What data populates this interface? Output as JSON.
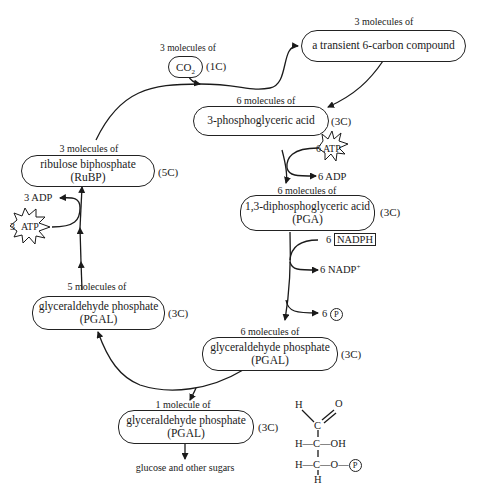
{
  "nodes": {
    "co2": {
      "count": "3 molecules of",
      "name": "CO",
      "sub": "2",
      "carbons": "(1C)"
    },
    "transient": {
      "count": "3 molecules of",
      "name": "a transient 6-carbon compound"
    },
    "pga3": {
      "count": "6 molecules of",
      "name": "3-phosphoglyceric acid",
      "carbons": "(3C)"
    },
    "dpga": {
      "count": "6 molecules of",
      "name": "1,3-diphosphoglyceric acid",
      "abbr": "(PGA)",
      "carbons": "(3C)"
    },
    "pgal6": {
      "count": "6 molecules of",
      "name": "glyceraldehyde phosphate",
      "abbr": "(PGAL)",
      "carbons": "(3C)"
    },
    "pgal5": {
      "count": "5 molecules of",
      "name": "glyceraldehyde phosphate",
      "abbr": "(PGAL)",
      "carbons": "(3C)"
    },
    "rubp": {
      "count": "3 molecules of",
      "name": "ribulose biphosphate",
      "abbr": "(RuBP)",
      "carbons": "(5C)"
    },
    "pgal1": {
      "count": "1 molecule of",
      "name": "glyceraldehyde phosphate",
      "abbr": "(PGAL)",
      "carbons": "(3C)"
    }
  },
  "side_reactions": {
    "atp_in_right": {
      "num": "6",
      "label": "ATP"
    },
    "adp_out_right": "6 ADP",
    "nadph_in": {
      "num": "6",
      "label": "NADPH"
    },
    "nadp_out": {
      "label": "6 NADP",
      "sup": "+"
    },
    "p_out": {
      "num": "6",
      "label": "P"
    },
    "atp_in_left": {
      "num": "3",
      "label": "ATP"
    },
    "adp_out_left": "3 ADP"
  },
  "output": {
    "label": "glucose and other sugars"
  },
  "structure": {
    "row1_h": "H",
    "row1_c": "C",
    "row1_o": "O",
    "row2": "H—C—OH",
    "row3_left": "H—C—O—",
    "row3_p": "P",
    "row4_h": "H"
  }
}
